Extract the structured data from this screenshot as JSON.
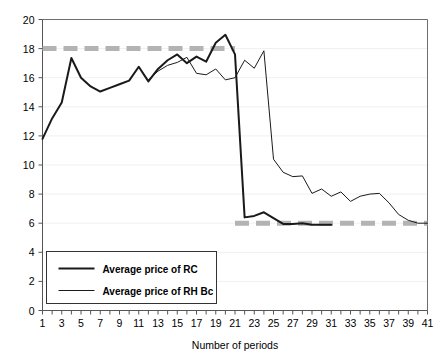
{
  "chart_data": {
    "type": "line",
    "title": "",
    "xlabel": "Number of periods",
    "ylabel": "",
    "xlim": [
      1,
      41
    ],
    "ylim": [
      0,
      20
    ],
    "grid": true,
    "grid_orientation": "horizontal",
    "legend_position": "bottom-left",
    "x_ticks": [
      1,
      3,
      5,
      7,
      9,
      11,
      13,
      15,
      17,
      19,
      21,
      23,
      25,
      27,
      29,
      31,
      33,
      35,
      37,
      39,
      41
    ],
    "x_minor_ticks_every": 1,
    "y_ticks": [
      0,
      2,
      4,
      6,
      8,
      10,
      12,
      14,
      16,
      18,
      20
    ],
    "series": [
      {
        "name": "Average price of RC",
        "color": "#1a1a1a",
        "width": 2.0,
        "x": [
          1,
          2,
          3,
          4,
          5,
          6,
          7,
          8,
          9,
          10,
          11,
          12,
          13,
          14,
          15,
          16,
          17,
          18,
          19,
          20,
          21,
          22,
          23,
          24,
          25,
          26,
          27,
          28,
          29,
          30,
          31
        ],
        "values": [
          11.8,
          13.2,
          14.3,
          17.35,
          16.0,
          15.4,
          15.05,
          15.3,
          15.55,
          15.8,
          16.75,
          15.75,
          16.6,
          17.2,
          17.6,
          17.0,
          17.45,
          17.1,
          18.4,
          18.95,
          17.6,
          6.4,
          6.5,
          6.75,
          6.35,
          5.95,
          5.95,
          6.0,
          5.9,
          5.9,
          5.9
        ]
      },
      {
        "name": "Average price of RH Bc",
        "color": "#1a1a1a",
        "width": 1.0,
        "x": [
          12,
          13,
          14,
          15,
          16,
          17,
          18,
          19,
          20,
          21,
          22,
          23,
          24,
          25,
          26,
          27,
          28,
          29,
          30,
          31,
          32,
          33,
          34,
          35,
          36,
          37,
          38,
          39,
          40,
          41
        ],
        "values": [
          15.85,
          16.45,
          16.85,
          17.05,
          17.4,
          16.3,
          16.2,
          16.6,
          15.85,
          16.0,
          17.2,
          16.65,
          17.85,
          10.4,
          9.5,
          9.2,
          9.25,
          8.05,
          8.35,
          7.85,
          8.15,
          7.5,
          7.85,
          8.0,
          8.05,
          7.4,
          6.6,
          6.2,
          6.0,
          6.0
        ]
      }
    ],
    "reference_lines": [
      {
        "name": "upper-reference",
        "y": 18.0,
        "x_start": 1,
        "x_end": 21,
        "color": "#b3b3b3",
        "style": "dashed"
      },
      {
        "name": "lower-reference",
        "y": 6.0,
        "x_start": 21,
        "x_end": 41,
        "color": "#b3b3b3",
        "style": "dashed"
      }
    ],
    "legend": [
      {
        "label": "Average price of RC",
        "swatch": "thick-line"
      },
      {
        "label": "Average price of RH Bc",
        "swatch": "thin-line"
      }
    ]
  },
  "axis": {
    "x_title": "Number of periods",
    "x_tick_labels": [
      "1",
      "3",
      "5",
      "7",
      "9",
      "11",
      "13",
      "15",
      "17",
      "19",
      "21",
      "23",
      "25",
      "27",
      "29",
      "31",
      "33",
      "35",
      "37",
      "39",
      "41"
    ],
    "y_tick_labels": [
      "0",
      "2",
      "4",
      "6",
      "8",
      "10",
      "12",
      "14",
      "16",
      "18",
      "20"
    ]
  },
  "colors": {
    "series_line": "#1a1a1a",
    "reference_line": "#b3b3b3",
    "grid": "#f0f0f0",
    "frame": "#6e6e6e",
    "background": "#ffffff",
    "text": "#000000"
  }
}
